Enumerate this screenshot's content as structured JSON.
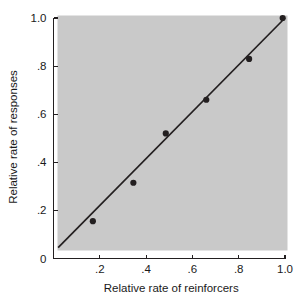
{
  "chart_data": {
    "type": "scatter",
    "title": "",
    "xlabel": "Relative rate of reinforcers",
    "ylabel": "Relative rate of responses",
    "xlim": [
      0,
      1.06
    ],
    "ylim": [
      0,
      1.06
    ],
    "grid": false,
    "legend": null,
    "panel_background": "#c9c9c9",
    "marker_color": "#231f20",
    "line_color": "#231f20",
    "axis_color": "#231f20",
    "xticks": [
      0.2,
      0.4,
      0.6,
      0.8,
      1.0
    ],
    "xticklabels": [
      ".2",
      ".4",
      ".6",
      ".8",
      "1.0"
    ],
    "yticks": [
      0,
      0.2,
      0.4,
      0.6,
      0.8,
      1.0
    ],
    "yticklabels": [
      "0",
      ".2",
      ".4",
      ".6",
      ".8",
      "1.0"
    ],
    "points": [
      {
        "x": 0.17,
        "y": 0.155
      },
      {
        "x": 0.345,
        "y": 0.315
      },
      {
        "x": 0.485,
        "y": 0.52
      },
      {
        "x": 0.66,
        "y": 0.66
      },
      {
        "x": 0.845,
        "y": 0.83
      },
      {
        "x": 0.99,
        "y": 1.0
      }
    ],
    "fit_line": {
      "x": [
        0.02,
        1.0
      ],
      "y": [
        0.045,
        1.0
      ]
    }
  }
}
